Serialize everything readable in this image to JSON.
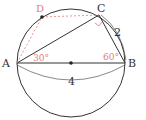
{
  "diagram": {
    "type": "circle-geometry",
    "colors": {
      "line": "#333333",
      "accent": "#e07b7b"
    },
    "points": {
      "A": {
        "label": "A",
        "x": 17,
        "y": 63
      },
      "B": {
        "label": "B",
        "x": 125,
        "y": 63
      },
      "C": {
        "label": "C",
        "x": 99,
        "y": 15
      },
      "D": {
        "label": "D",
        "x": 42,
        "y": 17
      },
      "O": {
        "label": "",
        "x": 71,
        "y": 63
      }
    },
    "angles": {
      "A": "30°",
      "B": "60°"
    },
    "lengths": {
      "BC": "2",
      "AB": "4"
    }
  }
}
